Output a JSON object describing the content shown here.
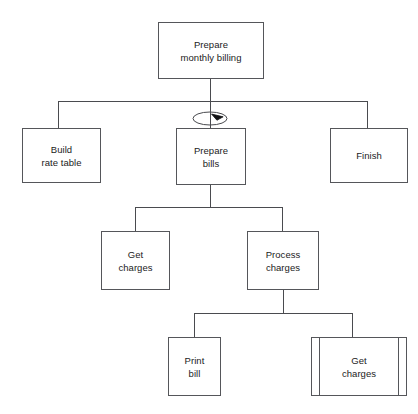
{
  "diagram": {
    "type": "structure-chart",
    "title_text": "",
    "background_color": "#ffffff",
    "line_color": "#4a4b4f",
    "text_color": "#1b1b1b",
    "nodes": [
      {
        "id": "prepare-monthly-billing",
        "label": "Prepare\nmonthly billing",
        "x": 158,
        "y": 22,
        "w": 106,
        "h": 57,
        "style": "plain",
        "level": 0
      },
      {
        "id": "build-rate-table",
        "label": "Build\nrate table",
        "x": 22,
        "y": 128,
        "w": 79,
        "h": 55,
        "style": "plain",
        "level": 1
      },
      {
        "id": "prepare-bills",
        "label": "Prepare\nbills",
        "x": 176,
        "y": 128,
        "w": 70,
        "h": 57,
        "style": "plain",
        "level": 1
      },
      {
        "id": "finish",
        "label": "Finish",
        "x": 330,
        "y": 128,
        "w": 78,
        "h": 55,
        "style": "plain",
        "level": 1
      },
      {
        "id": "get-charges",
        "label": "Get\ncharges",
        "x": 101,
        "y": 231,
        "w": 69,
        "h": 59,
        "style": "plain",
        "level": 2
      },
      {
        "id": "process-charges",
        "label": "Process\ncharges",
        "x": 247,
        "y": 231,
        "w": 72,
        "h": 59,
        "style": "plain",
        "level": 2
      },
      {
        "id": "print-bill",
        "label": "Print\nbill",
        "x": 168,
        "y": 337,
        "w": 53,
        "h": 59,
        "style": "plain",
        "level": 3
      },
      {
        "id": "get-charges-library",
        "label": "Get\ncharges",
        "x": 311,
        "y": 337,
        "w": 96,
        "h": 59,
        "style": "library",
        "level": 3
      }
    ],
    "connectors": [
      {
        "id": "trunk-root-to-bus1",
        "orient": "v",
        "x": 210,
        "y": 79,
        "len": 23
      },
      {
        "id": "bus-level-1",
        "orient": "h",
        "x": 58,
        "y": 101,
        "len": 310
      },
      {
        "id": "drop-build-rate-table",
        "orient": "v",
        "x": 58,
        "y": 101,
        "len": 28
      },
      {
        "id": "drop-prepare-bills",
        "orient": "v",
        "x": 210,
        "y": 101,
        "len": 28
      },
      {
        "id": "drop-finish",
        "orient": "v",
        "x": 367,
        "y": 101,
        "len": 28
      },
      {
        "id": "trunk-bills-to-bus2",
        "orient": "v",
        "x": 210,
        "y": 185,
        "len": 23
      },
      {
        "id": "bus-level-2",
        "orient": "h",
        "x": 135,
        "y": 207,
        "len": 148
      },
      {
        "id": "drop-get-charges",
        "orient": "v",
        "x": 135,
        "y": 207,
        "len": 25
      },
      {
        "id": "drop-process-charges",
        "orient": "v",
        "x": 282,
        "y": 207,
        "len": 25
      },
      {
        "id": "trunk-process-to-bus3",
        "orient": "v",
        "x": 283,
        "y": 290,
        "len": 24
      },
      {
        "id": "bus-level-3",
        "orient": "h",
        "x": 194,
        "y": 313,
        "len": 159
      },
      {
        "id": "drop-print-bill",
        "orient": "v",
        "x": 194,
        "y": 313,
        "len": 25
      },
      {
        "id": "drop-get-charges-lib",
        "orient": "v",
        "x": 352,
        "y": 313,
        "len": 25
      }
    ],
    "annotations": [
      {
        "id": "iteration-loop",
        "kind": "loop-arrow",
        "meaning": "iteration",
        "attached_to": "prepare-bills",
        "cx": 210,
        "cy": 118,
        "rx": 17,
        "ry": 6.5
      }
    ]
  }
}
